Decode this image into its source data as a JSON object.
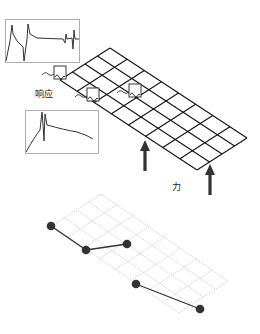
{
  "diagram": {
    "labels": {
      "response": "响应",
      "force": "力"
    },
    "top_grid": {
      "style": "solid",
      "color": "#111111",
      "corners": {
        "top": [
          110,
          48
        ],
        "left": [
          60,
          80
        ],
        "right": [
          247,
          138
        ],
        "bottom": [
          198,
          171
        ]
      },
      "short_divisions": 4,
      "long_divisions": 8
    },
    "bottom_grid": {
      "style": "dashed",
      "color": "#b8b8b8",
      "corners": {
        "top": [
          101,
          194
        ],
        "left": [
          52,
          226
        ],
        "right": [
          228,
          281
        ],
        "bottom": [
          179,
          318
        ]
      },
      "short_divisions": 4,
      "long_divisions": 8
    },
    "sensors": [
      {
        "box": [
          54,
          66,
          12,
          13
        ]
      },
      {
        "box": [
          87,
          88,
          12,
          13
        ]
      },
      {
        "box": [
          129,
          84,
          12,
          13
        ]
      }
    ],
    "force_arrows": [
      {
        "x": 145,
        "tip_y": 140,
        "bottom_y": 171
      },
      {
        "x": 210,
        "tip_y": 164,
        "bottom_y": 195
      }
    ],
    "response_charts": [
      {
        "box": [
          5,
          19,
          74,
          43
        ]
      },
      {
        "box": [
          25,
          110,
          73,
          43
        ]
      }
    ],
    "mode_shape_points": [
      [
        51,
        226
      ],
      [
        86,
        250
      ],
      [
        127,
        244
      ],
      [
        136,
        284
      ],
      [
        200,
        309
      ]
    ],
    "mode_shape_segments": [
      [
        0,
        1
      ],
      [
        1,
        2
      ],
      [
        3,
        4
      ]
    ]
  }
}
